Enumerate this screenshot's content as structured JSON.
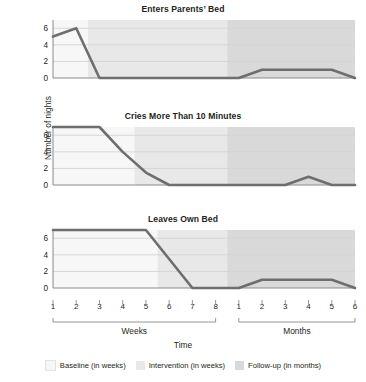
{
  "figure": {
    "ylabel": "Number of nights",
    "xlabel": "Time",
    "group_labels": [
      "Weeks",
      "Months"
    ]
  },
  "legend": {
    "items": [
      {
        "label": "Baseline (in weeks)",
        "color": "#f7f7f7"
      },
      {
        "label": "Intervention (in weeks)",
        "color": "#e8e8e8"
      },
      {
        "label": "Follow-up (in months)",
        "color": "#d9d9d9"
      }
    ]
  },
  "colors": {
    "line": "#6d6e71",
    "grid": "#d4d4d4",
    "axis": "#8a8a8a",
    "baseline_band": "#f7f7f7",
    "intervention_band": "#e8e8e8",
    "followup_band": "#d9d9d9",
    "text": "#231f20"
  },
  "chart_data": [
    {
      "type": "line",
      "title": "Enters Parents’ Bed",
      "xlabel": "Time",
      "ylabel": "Number of nights",
      "ylim": [
        0,
        7
      ],
      "yticks": [
        0,
        2,
        4,
        6
      ],
      "grid": true,
      "legend_position": "bottom",
      "categories": [
        "W1",
        "W2",
        "W3",
        "W4",
        "W5",
        "W6",
        "W7",
        "W8",
        "M1",
        "M2",
        "M3",
        "M4",
        "M5",
        "M6"
      ],
      "tick_labels": [
        "1",
        "2",
        "3",
        "4",
        "5",
        "6",
        "7",
        "8",
        "1",
        "2",
        "3",
        "4",
        "5",
        "6"
      ],
      "values": [
        5,
        6,
        0,
        0,
        0,
        0,
        0,
        0,
        0,
        1,
        1,
        1,
        1,
        0
      ],
      "phase_boundary_index": 1.5,
      "followup_start_index": 7.5
    },
    {
      "type": "line",
      "title": "Cries More Than 10 Minutes",
      "xlabel": "Time",
      "ylabel": "Number of nights",
      "ylim": [
        0,
        7
      ],
      "yticks": [
        0,
        2,
        4,
        6
      ],
      "grid": true,
      "legend_position": "bottom",
      "categories": [
        "W1",
        "W2",
        "W3",
        "W4",
        "W5",
        "W6",
        "W7",
        "W8",
        "M1",
        "M2",
        "M3",
        "M4",
        "M5",
        "M6"
      ],
      "tick_labels": [
        "1",
        "2",
        "3",
        "4",
        "5",
        "6",
        "7",
        "8",
        "1",
        "2",
        "3",
        "4",
        "5",
        "6"
      ],
      "values": [
        7,
        7,
        7,
        4,
        1.5,
        0,
        0,
        0,
        0,
        0,
        0,
        1,
        0,
        0
      ],
      "phase_boundary_index": 3.5,
      "followup_start_index": 7.5
    },
    {
      "type": "line",
      "title": "Leaves Own Bed",
      "xlabel": "Time",
      "ylabel": "Number of nights",
      "ylim": [
        0,
        7
      ],
      "yticks": [
        0,
        2,
        4,
        6
      ],
      "grid": true,
      "legend_position": "bottom",
      "categories": [
        "W1",
        "W2",
        "W3",
        "W4",
        "W5",
        "W6",
        "W7",
        "W8",
        "M1",
        "M2",
        "M3",
        "M4",
        "M5",
        "M6"
      ],
      "tick_labels": [
        "1",
        "2",
        "3",
        "4",
        "5",
        "6",
        "7",
        "8",
        "1",
        "2",
        "3",
        "4",
        "5",
        "6"
      ],
      "values": [
        7,
        7,
        7,
        7,
        7,
        3.5,
        0,
        0,
        0,
        1,
        1,
        1,
        1,
        0
      ],
      "phase_boundary_index": 4.5,
      "followup_start_index": 7.5
    }
  ]
}
